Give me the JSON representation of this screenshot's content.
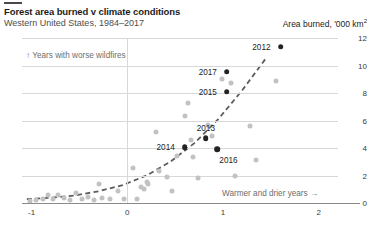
{
  "header": {
    "title": "Forest area burned v climate conditions",
    "subtitle": "Western United States, 1984–2017",
    "y_axis_title": "Area burned, '000 km",
    "y_axis_title_sup": "2"
  },
  "annotations": {
    "top_left": "↑ Years with worse wildfires",
    "bottom_right": "Warmer and drier years →"
  },
  "chart_data": {
    "type": "scatter",
    "title": "Forest area burned v climate conditions",
    "subtitle": "Western United States, 1984–2017",
    "xlabel": "",
    "ylabel": "Area burned, '000 km2",
    "xlim": [
      -1.1,
      2.2
    ],
    "ylim": [
      0,
      12
    ],
    "xticks": [
      -1,
      0,
      1,
      2
    ],
    "xticklabels": [
      "-1",
      "0",
      "1",
      "2"
    ],
    "yticks": [
      0,
      2,
      4,
      6,
      8,
      10,
      12
    ],
    "yticklabels": [
      "0",
      "2",
      "4",
      "6",
      "8",
      "10",
      "12"
    ],
    "grid": "horizontal-and-zero-vertical",
    "legend": "none",
    "points": [
      {
        "x": -1.02,
        "y": 0.18,
        "highlight": false
      },
      {
        "x": -0.95,
        "y": 0.22,
        "highlight": false
      },
      {
        "x": -0.88,
        "y": 0.3,
        "highlight": false
      },
      {
        "x": -0.83,
        "y": 0.55,
        "highlight": false
      },
      {
        "x": -0.78,
        "y": 0.28,
        "highlight": false
      },
      {
        "x": -0.72,
        "y": 0.6,
        "highlight": false
      },
      {
        "x": -0.66,
        "y": 0.35,
        "highlight": false
      },
      {
        "x": -0.6,
        "y": 0.25,
        "highlight": false
      },
      {
        "x": -0.54,
        "y": 0.7,
        "highlight": false
      },
      {
        "x": -0.47,
        "y": 0.3,
        "highlight": false
      },
      {
        "x": -0.41,
        "y": 0.45,
        "highlight": false
      },
      {
        "x": -0.35,
        "y": 0.2,
        "highlight": false
      },
      {
        "x": -0.3,
        "y": 1.35,
        "highlight": false
      },
      {
        "x": -0.26,
        "y": 0.4,
        "highlight": false
      },
      {
        "x": -0.18,
        "y": 0.3,
        "highlight": false
      },
      {
        "x": -0.1,
        "y": 0.85,
        "highlight": false
      },
      {
        "x": -0.04,
        "y": 0.28,
        "highlight": false
      },
      {
        "x": 0.06,
        "y": 2.55,
        "highlight": false
      },
      {
        "x": 0.1,
        "y": 0.32,
        "highlight": false
      },
      {
        "x": 0.14,
        "y": 1.2,
        "highlight": false
      },
      {
        "x": 0.17,
        "y": 1.05,
        "highlight": false
      },
      {
        "x": 0.21,
        "y": 1.55,
        "highlight": false
      },
      {
        "x": 0.22,
        "y": 1.35,
        "highlight": false
      },
      {
        "x": 0.3,
        "y": 5.15,
        "highlight": false
      },
      {
        "x": 0.33,
        "y": 2.35,
        "highlight": false
      },
      {
        "x": 0.41,
        "y": 1.9,
        "highlight": false
      },
      {
        "x": 0.47,
        "y": 0.9,
        "highlight": false
      },
      {
        "x": 0.52,
        "y": 3.45,
        "highlight": false
      },
      {
        "x": 0.6,
        "y": 6.35,
        "highlight": false
      },
      {
        "x": 0.63,
        "y": 7.25,
        "highlight": false
      },
      {
        "x": 0.66,
        "y": 4.6,
        "highlight": false
      },
      {
        "x": 0.69,
        "y": 3.35,
        "highlight": false
      },
      {
        "x": 0.74,
        "y": 1.85,
        "highlight": false
      },
      {
        "x": 0.84,
        "y": 5.65,
        "highlight": false
      },
      {
        "x": 0.88,
        "y": 4.85,
        "highlight": false
      },
      {
        "x": 0.99,
        "y": 9.05,
        "highlight": false
      },
      {
        "x": 1.08,
        "y": 8.7,
        "highlight": false
      },
      {
        "x": 1.12,
        "y": 1.95,
        "highlight": false
      },
      {
        "x": 1.28,
        "y": 5.6,
        "highlight": false
      },
      {
        "x": 1.34,
        "y": 3.1,
        "highlight": false
      },
      {
        "x": 1.55,
        "y": 8.9,
        "highlight": false
      },
      {
        "x": 0.6,
        "y": 4.05,
        "label": "2014",
        "highlight": true
      },
      {
        "x": 0.82,
        "y": 4.7,
        "label": "2013",
        "highlight": true
      },
      {
        "x": 0.94,
        "y": 3.9,
        "label": "2016",
        "highlight": true
      },
      {
        "x": 1.04,
        "y": 8.1,
        "label": "2015",
        "highlight": true
      },
      {
        "x": 1.04,
        "y": 9.55,
        "label": "2017",
        "highlight": true
      },
      {
        "x": 1.6,
        "y": 11.35,
        "label": "2012",
        "highlight": true
      }
    ],
    "trendline": {
      "style": "dashed",
      "color": "#5d5d5d",
      "description": "exponential fit rising left to right",
      "points": [
        {
          "x": -1.05,
          "y": 0.28
        },
        {
          "x": -0.8,
          "y": 0.38
        },
        {
          "x": -0.55,
          "y": 0.55
        },
        {
          "x": -0.3,
          "y": 0.85
        },
        {
          "x": -0.05,
          "y": 1.3
        },
        {
          "x": 0.2,
          "y": 2.0
        },
        {
          "x": 0.45,
          "y": 3.0
        },
        {
          "x": 0.7,
          "y": 4.35
        },
        {
          "x": 0.95,
          "y": 6.1
        },
        {
          "x": 1.2,
          "y": 8.2
        },
        {
          "x": 1.45,
          "y": 10.55
        }
      ]
    }
  },
  "colors": {
    "point": "#c2c2c2",
    "point_highlight": "#232323",
    "trendline": "#5d5d5d",
    "gridline": "#d8d8d8",
    "axis": "#8a8a8a"
  }
}
